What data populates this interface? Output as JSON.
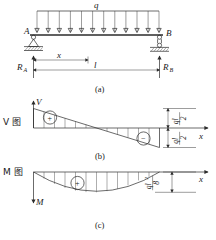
{
  "figure": {
    "title_implicit": "Simply supported beam with uniform load: shear and moment diagrams",
    "load_label": "q",
    "support_a_label": "A",
    "support_b_label": "B",
    "reaction_a_label": "R",
    "reaction_a_sub": "A",
    "reaction_b_label": "R",
    "reaction_b_sub": "B",
    "dim_x_label": "x",
    "dim_l_label": "l",
    "captions": {
      "a": "(a)",
      "b": "(b)",
      "c": "(c)"
    },
    "shear_panel": {
      "diagram_name": "V 图",
      "axis_v_label": "V",
      "axis_x_label": "x",
      "positive_sign": "+",
      "negative_sign": "−",
      "value_top_numerator": "ql",
      "value_top_denominator": "2",
      "value_bottom_numerator": "ql",
      "value_bottom_denominator": "2"
    },
    "moment_panel": {
      "diagram_name": "M 图",
      "axis_m_label": "M",
      "axis_x_label": "x",
      "positive_sign": "+",
      "value_numerator": "ql",
      "value_numerator_exp": "2",
      "value_denominator": "8"
    },
    "colors": {
      "ink": "#2b2b2b",
      "hatch": "#4a4a4a",
      "background": "#ffffff"
    }
  }
}
